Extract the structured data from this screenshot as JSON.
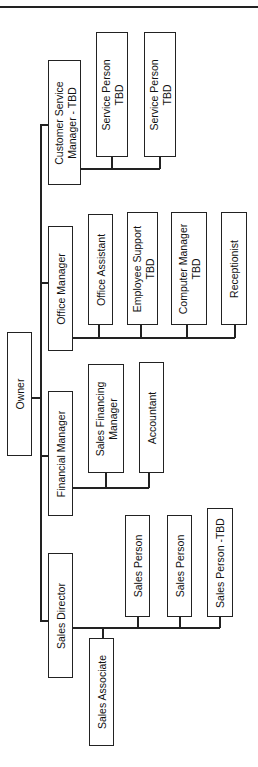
{
  "chart": {
    "orientation": "rotated-90-ccw",
    "root": {
      "label": "Owner",
      "children": [
        {
          "label": "Customer Service Manager - TBD",
          "lines": [
            "Customer Service",
            "Manager - TBD"
          ],
          "children": [
            {
              "label": "Service Person TBD",
              "lines": [
                "Service Person",
                "TBD"
              ]
            },
            {
              "label": "Service Person TBD",
              "lines": [
                "Service Person",
                "TBD"
              ]
            }
          ]
        },
        {
          "label": "Office Manager",
          "children": [
            {
              "label": "Office Assistant"
            },
            {
              "label": "Employee Support TBD",
              "lines": [
                "Employee Support",
                "TBD"
              ]
            },
            {
              "label": "Computer Manager TBD",
              "lines": [
                "Computer Manager",
                "TBD"
              ]
            },
            {
              "label": "Receptionist"
            }
          ]
        },
        {
          "label": "Financial Manager",
          "children": [
            {
              "label": "Sales Financing Manager",
              "lines": [
                "Sales Financing",
                "Manager"
              ]
            },
            {
              "label": "Accountant"
            }
          ]
        },
        {
          "label": "Sales Director",
          "children": [
            {
              "label": "Sales Associate"
            },
            {
              "label": "Sales Person"
            },
            {
              "label": "Sales Person"
            },
            {
              "label": "Sales Person -TBD"
            }
          ]
        }
      ]
    }
  },
  "nodes": {
    "owner": "Owner",
    "csm_l1": "Customer Service",
    "csm_l2": "Manager - TBD",
    "sp1_l1": "Service Person",
    "sp1_l2": "TBD",
    "sp2_l1": "Service Person",
    "sp2_l2": "TBD",
    "office_manager": "Office Manager",
    "office_assistant": "Office Assistant",
    "emp_support_l1": "Employee Support",
    "emp_support_l2": "TBD",
    "computer_mgr_l1": "Computer Manager",
    "computer_mgr_l2": "TBD",
    "receptionist": "Receptionist",
    "financial_manager": "Financial Manager",
    "sfm_l1": "Sales Financing",
    "sfm_l2": "Manager",
    "accountant": "Accountant",
    "sales_director": "Sales Director",
    "sales_associate": "Sales Associate",
    "sales_person_1": "Sales Person",
    "sales_person_2": "Sales Person",
    "sales_person_tbd": "Sales Person -TBD"
  }
}
